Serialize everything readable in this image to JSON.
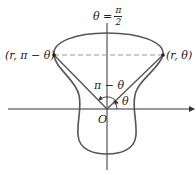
{
  "diagram": {
    "type": "polar-symmetry-figure",
    "axis_label_top": {
      "lhs": "θ =",
      "numerator": "π",
      "denominator": "2"
    },
    "point_left_label": "(r, π − θ)",
    "point_right_label": "(r, θ)",
    "angle_left_label": "π − θ",
    "angle_right_label": "θ",
    "origin_label": "O",
    "colors": {
      "curve": "#555555",
      "axes": "#333333",
      "dashed": "#9a9a9a",
      "text": "#222222"
    }
  }
}
